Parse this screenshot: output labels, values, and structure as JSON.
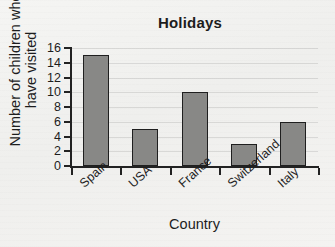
{
  "chart_data": {
    "type": "bar",
    "title": "Holidays",
    "xlabel": "Country",
    "ylabel_lines": [
      "Number of children who",
      "have visited"
    ],
    "ylabel": "Number of children who have visited",
    "categories": [
      "Spain",
      "USA",
      "France",
      "Switzerland",
      "Italy"
    ],
    "values": [
      15,
      5,
      10,
      3,
      6
    ],
    "ylim": [
      0,
      16
    ],
    "ytick_labels": [
      "0",
      "2",
      "4",
      "6",
      "8",
      "10",
      "12",
      "14",
      "16"
    ],
    "ytick_values": [
      0,
      2,
      4,
      6,
      8,
      10,
      12,
      14,
      16
    ],
    "grid": true,
    "legend": null,
    "colors": {
      "bar_fill": "#888886",
      "bar_edge": "#1f1f1f",
      "axis": "#222222",
      "gridline": "#bdbdbd",
      "background": "#f2f2f0",
      "text": "#1d1d1d"
    }
  }
}
